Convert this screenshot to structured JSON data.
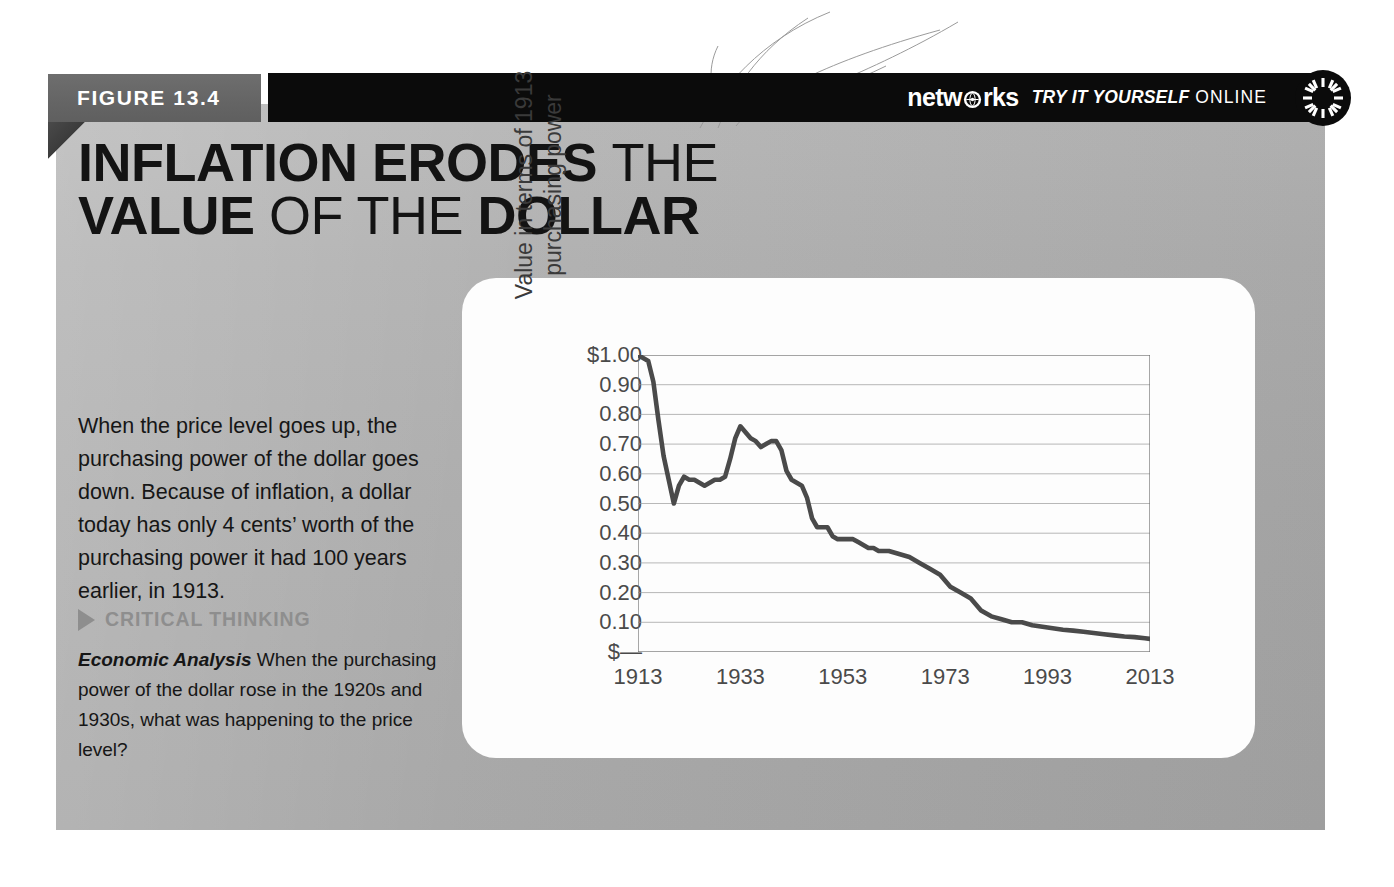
{
  "figure": {
    "tab_label": "FIGURE 13.4",
    "title_parts": [
      {
        "text": "INFLATION ERODES ",
        "weight": "bold"
      },
      {
        "text": "THE",
        "weight": "light"
      },
      {
        "text": "VALUE ",
        "weight": "bold"
      },
      {
        "text": "OF THE ",
        "weight": "light"
      },
      {
        "text": "DOLLAR",
        "weight": "bold"
      }
    ],
    "title_line1_bold": "INFLATION ERODES ",
    "title_line1_light": "THE",
    "title_line2_bold_a": "VALUE ",
    "title_line2_light": "OF THE ",
    "title_line2_bold_b": "DOLLAR"
  },
  "header": {
    "brand": "netw rks",
    "brand_pre": "netw",
    "brand_post": "rks",
    "tagline_italic": "TRY IT YOURSELF",
    "tagline_plain": " ONLINE"
  },
  "body": {
    "lead": "When the price level goes up, the purchasing power of the dollar goes down. Because of inflation, a dollar today has only 4 cents’ worth of the purchasing power it had 100 years earlier, in 1913.",
    "critical_thinking_label": "CRITICAL THINKING",
    "question_label": "Economic Analysis",
    "question_text": " When the purchasing power of the dollar rose in the 1920s and 1930s, what was happening to the price level?"
  },
  "footer": {
    "url": "connected.mcgraw-hill.com"
  },
  "colors": {
    "panel_gray": "#a8a8a8",
    "header_black": "#0b0b0b",
    "tab_gray": "#666666",
    "line_color": "#4a4a4a",
    "grid_color": "#9a9a9a",
    "card_white": "#fdfdfd",
    "ct_gray": "#8e8e8e"
  },
  "chart_data": {
    "type": "line",
    "title": "Inflation Erodes the Value of the Dollar",
    "xlabel": "",
    "ylabel": "Value in terms of 1913 purchasing power",
    "ylabel_line1": "Value in terms of 1913",
    "ylabel_line2": "purchasing power",
    "xlim": [
      1913,
      2013
    ],
    "ylim": [
      0,
      1.0
    ],
    "grid": true,
    "legend": "none",
    "ytick_labels": [
      "$1.00",
      "0.90",
      "0.80",
      "0.70",
      "0.60",
      "0.50",
      "0.40",
      "0.30",
      "0.20",
      "0.10",
      "$—"
    ],
    "ytick_values": [
      1.0,
      0.9,
      0.8,
      0.7,
      0.6,
      0.5,
      0.4,
      0.3,
      0.2,
      0.1,
      0.0
    ],
    "xtick_labels": [
      "1913",
      "1933",
      "1953",
      "1973",
      "1993",
      "2013"
    ],
    "xtick_values": [
      1913,
      1933,
      1953,
      1973,
      1993,
      2013
    ],
    "series": [
      {
        "name": "Purchasing power of the dollar (1913 = $1.00)",
        "x": [
          1913,
          1914,
          1915,
          1916,
          1917,
          1918,
          1919,
          1920,
          1921,
          1922,
          1923,
          1924,
          1925,
          1926,
          1927,
          1928,
          1929,
          1930,
          1931,
          1932,
          1933,
          1934,
          1935,
          1936,
          1937,
          1938,
          1939,
          1940,
          1941,
          1942,
          1943,
          1944,
          1945,
          1946,
          1947,
          1948,
          1949,
          1950,
          1951,
          1952,
          1953,
          1954,
          1955,
          1956,
          1957,
          1958,
          1959,
          1960,
          1962,
          1964,
          1966,
          1968,
          1970,
          1972,
          1974,
          1976,
          1978,
          1980,
          1982,
          1984,
          1986,
          1988,
          1990,
          1992,
          1994,
          1996,
          1998,
          2000,
          2002,
          2004,
          2006,
          2008,
          2010,
          2012,
          2013
        ],
        "values": [
          1.0,
          0.99,
          0.98,
          0.91,
          0.78,
          0.66,
          0.58,
          0.5,
          0.56,
          0.59,
          0.58,
          0.58,
          0.57,
          0.56,
          0.57,
          0.58,
          0.58,
          0.59,
          0.65,
          0.72,
          0.76,
          0.74,
          0.72,
          0.71,
          0.69,
          0.7,
          0.71,
          0.71,
          0.68,
          0.61,
          0.58,
          0.57,
          0.56,
          0.52,
          0.45,
          0.42,
          0.42,
          0.42,
          0.39,
          0.38,
          0.38,
          0.38,
          0.38,
          0.37,
          0.36,
          0.35,
          0.35,
          0.34,
          0.34,
          0.33,
          0.32,
          0.3,
          0.28,
          0.26,
          0.22,
          0.2,
          0.18,
          0.14,
          0.12,
          0.11,
          0.1,
          0.1,
          0.09,
          0.085,
          0.08,
          0.075,
          0.072,
          0.068,
          0.064,
          0.06,
          0.056,
          0.052,
          0.05,
          0.046,
          0.044
        ]
      }
    ]
  }
}
